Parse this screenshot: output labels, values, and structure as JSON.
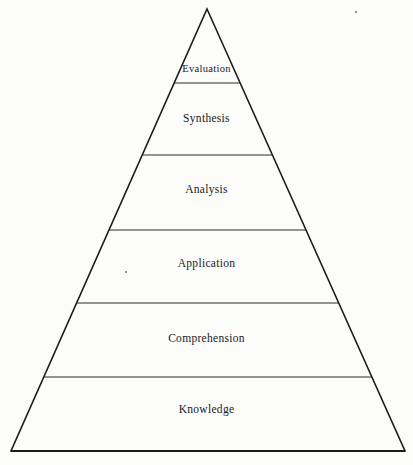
{
  "figure": {
    "name": "blooms-taxonomy-pyramid",
    "background_color": "#fcfcfb",
    "stroke_color": "#1c1c1c",
    "text_color": "#1a1a1a"
  },
  "chart_data": {
    "type": "pyramid",
    "title": "",
    "subtitle": "",
    "xlabel": "",
    "ylabel": "",
    "legend": [],
    "orientation": "apex-up",
    "apex": {
      "x": 207,
      "y": 9
    },
    "base_left": {
      "x": 11,
      "y": 451
    },
    "base_right": {
      "x": 405,
      "y": 451
    },
    "divider_y": [
      83,
      155,
      230,
      303,
      377
    ],
    "categories": [
      "Evaluation",
      "Synthesis",
      "Analysis",
      "Application",
      "Comprehension",
      "Knowledge"
    ],
    "levels": [
      {
        "rank": 6,
        "label": "Evaluation",
        "top_y": 9,
        "bottom_y": 83,
        "label_y": 72,
        "font_size": 10.5
      },
      {
        "rank": 5,
        "label": "Synthesis",
        "top_y": 83,
        "bottom_y": 155,
        "label_y": 122,
        "font_size": 11.5
      },
      {
        "rank": 4,
        "label": "Analysis",
        "top_y": 155,
        "bottom_y": 230,
        "label_y": 193,
        "font_size": 11.5
      },
      {
        "rank": 3,
        "label": "Application",
        "top_y": 230,
        "bottom_y": 303,
        "label_y": 267,
        "font_size": 11.5
      },
      {
        "rank": 2,
        "label": "Comprehension",
        "top_y": 303,
        "bottom_y": 377,
        "label_y": 342,
        "font_size": 11.5
      },
      {
        "rank": 1,
        "label": "Knowledge",
        "top_y": 377,
        "bottom_y": 451,
        "label_y": 413,
        "font_size": 11.5
      }
    ]
  },
  "artifacts": [
    {
      "name": "scan-speck-upper-right",
      "x": 355,
      "y": 11,
      "size": 2
    },
    {
      "name": "scan-speck-application",
      "x": 125,
      "y": 271,
      "size": 2
    }
  ]
}
